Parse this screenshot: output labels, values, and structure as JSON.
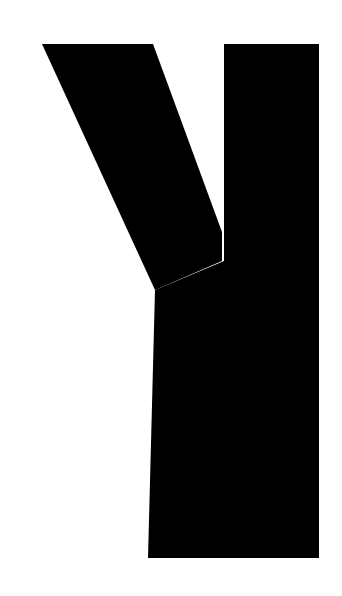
{
  "image": {
    "kind": "glyph-image",
    "subject": "letter-K",
    "character": "K",
    "script": "Latin",
    "case": "uppercase",
    "style": "sans-serif bold",
    "width": 342,
    "height": 596,
    "background_color": "#ffffff",
    "foreground_color": "#000000",
    "alt_text": "Bold black uppercase letter K on a white background"
  },
  "geometry": {
    "units": "pixels",
    "viewbox": "0 0 342 596",
    "stem": {
      "name": "vertical-stem",
      "x_left": 224,
      "x_right": 319,
      "y_top": 44,
      "y_bottom": 558,
      "path": "M224,44 L319,44 L319,558 L224,558 Z"
    },
    "upper_arm": {
      "name": "upper-diagonal-arm",
      "vertices": [
        [
          42,
          44
        ],
        [
          153,
          44
        ],
        [
          222,
          232
        ],
        [
          222,
          260
        ],
        [
          155,
          290
        ],
        [
          98,
          182
        ]
      ],
      "path": "M42,44 L153,44 L222,232 L222,261 L155,290 Z"
    },
    "lower_leg": {
      "name": "lower-diagonal-leg",
      "vertices": [
        [
          155,
          290
        ],
        [
          222,
          261
        ],
        [
          222,
          558
        ],
        [
          148,
          558
        ],
        [
          33,
          558
        ]
      ],
      "path": "M155,290 L224,261 L224,558 L148,558 Z"
    },
    "notch_vertex": [
      155,
      290
    ],
    "wedge_tip": [
      222,
      232
    ],
    "bottom_left_vertex": [
      33,
      558
    ],
    "bottom_leg_right_vertex": [
      148,
      558
    ],
    "combined_path": "M224,44 L319,44 L319,558 L224,558 L224,558 Z M42,44 L153,44 L224,241 L224,261 L157,290 L148,558 L33,558 L155,290 L98,182 Z"
  },
  "palette": {
    "ink": "#000000",
    "paper": "#ffffff"
  },
  "caption": {
    "label": "K"
  }
}
